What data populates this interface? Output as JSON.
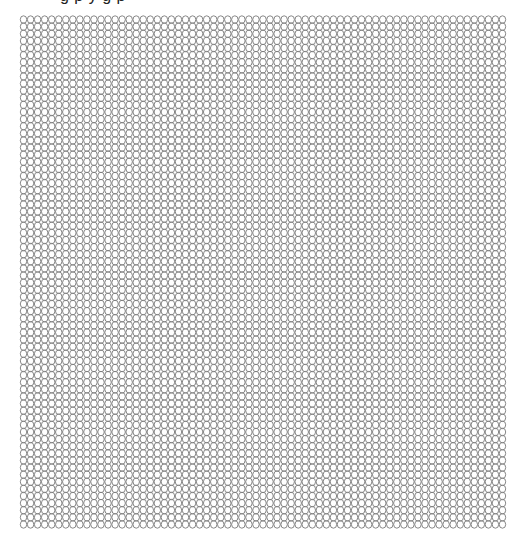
{
  "header": {
    "cut_off_text": "g p y   g  p"
  },
  "grid": {
    "shape": "ellipse-outline",
    "columns": 69,
    "rows": 72,
    "stroke_color": "#7a7a7a",
    "background_color": "#ffffff"
  }
}
